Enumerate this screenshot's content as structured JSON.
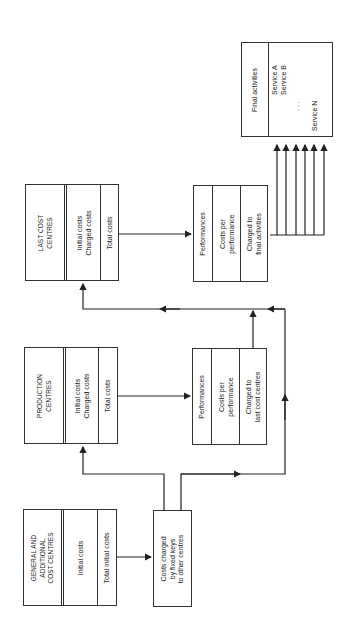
{
  "diagram": {
    "orientation": "rotated 90 degrees counter-clockwise",
    "boxes": {
      "general": {
        "title": "GENERAL AND\nADDITIONAL\nCOST CENTRES",
        "row2": "Initial costs",
        "row3": "Total initial costs"
      },
      "costs_charged": {
        "text": "Costs charged\nby fixed keys\nto other centres"
      },
      "production": {
        "title": "PRODUCTION\nCENTRES",
        "row2": "Initial costs\nCharged costs",
        "row3": "Total costs"
      },
      "production_performance": {
        "row1": "Performances",
        "row2": "Costs per\nperformance",
        "row3": "Charged to\nlast cost centres"
      },
      "last": {
        "title": "LAST COST\nCENTRES",
        "row2": "Initial costs\nCharged costs",
        "row3": "Total costs"
      },
      "last_performance": {
        "row1": "Performances",
        "row2": "Costs per\nperformance",
        "row3": "Charged to\nfinal activities"
      },
      "final": {
        "title": "Final activities",
        "service_a": "Service A",
        "service_b": "Service B",
        "dots": ". . .",
        "service_n": "Service N"
      }
    },
    "line_color": "#222222",
    "fanout_arrow_count": 6
  }
}
